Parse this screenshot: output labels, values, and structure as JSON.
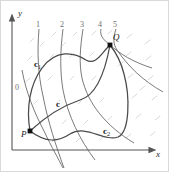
{
  "figure": {
    "kind": "line-integral-level-curve-diagram",
    "background": "#ffffff",
    "border_color": "#d9d9d9",
    "width": 169,
    "height": 172
  },
  "axes": {
    "x_label": "x",
    "y_label": "y",
    "axis_color": "#555555",
    "origin": {
      "x": 12,
      "y": 150
    },
    "x_end": {
      "x": 152,
      "y": 150
    },
    "y_end": {
      "x": 12,
      "y": 18
    }
  },
  "level_curves": {
    "color": "#6b6b6b",
    "hatch_color": "#c9c9c9",
    "labels": [
      "0",
      "1",
      "2",
      "3",
      "4",
      "5"
    ],
    "label_positions": [
      {
        "text": "0",
        "x": 15,
        "y": 84
      },
      {
        "text": "1",
        "x": 36,
        "y": 21
      },
      {
        "text": "2",
        "x": 60,
        "y": 21
      },
      {
        "text": "3",
        "x": 80,
        "y": 21
      },
      {
        "text": "4",
        "x": 98,
        "y": 21
      },
      {
        "text": "5",
        "x": 113,
        "y": 21
      }
    ],
    "curves": [
      {
        "label": "0",
        "d": "M 22,70 C 26,92 34,112 44,131 C 52,148 58,158 63,168"
      },
      {
        "label": "1",
        "d": "M 39,29 C 37,52 38,74 43,96 C 48,122 56,146 64,168"
      },
      {
        "label": "2",
        "d": "M 63,29 C 60,52 60,72 63,90 C 68,116 80,140 95,160"
      },
      {
        "label": "3",
        "d": "M 83,29 C 80,48 79,64 82,78 C 88,104 106,126 134,143"
      },
      {
        "label": "4",
        "d": "M 101,29 C 99,36 105,41 110,45 C 120,54 133,62 152,68"
      },
      {
        "label": "5",
        "d": "M 116,29 C 113,38 113,44 117,50 C 128,66 142,80 163,92"
      }
    ]
  },
  "paths": [
    {
      "name": "c1",
      "label": "c",
      "subscript": "1",
      "label_x": 34,
      "label_y": 60,
      "color": "#4a4a4a",
      "d": "M 30,131 C 26,108 30,84 42,68 C 56,49 74,52 86,60 C 96,66 102,52 110,45"
    },
    {
      "name": "c",
      "label": "c",
      "subscript": "",
      "label_x": 56,
      "label_y": 100,
      "color": "#4a4a4a",
      "d": "M 30,131 C 44,118 62,106 80,100 C 94,96 104,78 110,45"
    },
    {
      "name": "c2",
      "label": "c",
      "subscript": "2",
      "label_x": 103,
      "label_y": 127,
      "color": "#4a4a4a",
      "d": "M 30,131 C 46,143 58,142 70,134 C 86,124 104,142 118,137 C 130,132 130,96 124,74 C 120,58 114,50 110,45"
    }
  ],
  "points": [
    {
      "name": "P",
      "label": "P",
      "x": 30,
      "y": 131,
      "label_x": 21,
      "label_y": 130,
      "color": "#111111"
    },
    {
      "name": "Q",
      "label": "Q",
      "x": 110,
      "y": 45,
      "label_x": 113,
      "label_y": 33,
      "color": "#111111"
    }
  ]
}
